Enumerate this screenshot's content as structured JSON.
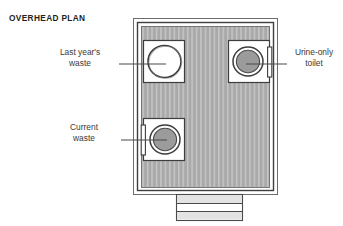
{
  "title": "OVERHEAD PLAN",
  "callouts": {
    "last_year_waste": "Last year's\nwaste",
    "current_waste": "Current\nwaste",
    "urine_toilet": "Urine-only\ntoilet"
  },
  "diagram": {
    "view": "overhead plan",
    "structure": {
      "outer_wall_color": "#4a4a4a",
      "floor_fill": "#a8a8a8",
      "floor_stripe_color": "#c4c4c4",
      "floor_pattern": "vertical slats",
      "floor_stripe_count": 33,
      "fixture_panel_fill": "#ffffff",
      "chamber_gray_fill": "#9a9a9a",
      "outline_color": "#3d3d3d",
      "leader_line_color": "#4a4a4a"
    },
    "fixtures": [
      {
        "name": "last-years-waste-chamber",
        "label": "Last year's waste",
        "position": "top-left",
        "state": "open",
        "fill": "none",
        "has_lid_bar": false
      },
      {
        "name": "current-waste-chamber",
        "label": "Current waste",
        "position": "mid-left",
        "state": "closed",
        "fill": "#9a9a9a",
        "has_lid_bar": true,
        "lid_bar_side": "left"
      },
      {
        "name": "urine-only-toilet",
        "label": "Urine-only toilet",
        "position": "top-right",
        "state": "closed",
        "fill": "#9a9a9a",
        "has_lid_bar": true,
        "lid_bar_side": "right"
      }
    ],
    "steps": {
      "name": "entry-steps",
      "position": "bottom-center",
      "tread_count": 3,
      "tread_fill_light": "#ffffff",
      "tread_fill_shade": "#e2e2e2"
    }
  }
}
